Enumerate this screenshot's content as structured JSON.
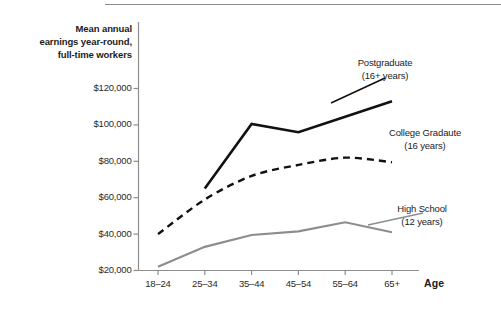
{
  "figure": {
    "axis_title_lines": [
      "Mean annual",
      "earnings year-round,",
      "full-time workers"
    ],
    "x_axis_name": "Age"
  },
  "chart_data": {
    "type": "line",
    "title": "Mean annual earnings year-round, full-time workers",
    "xlabel": "Age",
    "ylabel": "Mean annual earnings year-round, full-time workers",
    "categories": [
      "18–24",
      "25–34",
      "35–44",
      "45–54",
      "55–64",
      "65+"
    ],
    "ytick_labels": [
      "$20,000",
      "$40,000",
      "$60,000",
      "$80,000",
      "$100,000",
      "$120,000"
    ],
    "ytick_values": [
      20000,
      40000,
      60000,
      80000,
      100000,
      120000
    ],
    "ylim": [
      20000,
      130000
    ],
    "grid": false,
    "legend": "inline-right",
    "series": [
      {
        "name": "Postgraduate",
        "label_line1": "Postgraduate",
        "label_line2": "(16+ years)",
        "style": "solid",
        "color": "#111111",
        "width": 2.6,
        "x": [
          "25–34",
          "35–44",
          "45–54",
          "55–64",
          "65+"
        ],
        "values": [
          65000,
          100500,
          96000,
          104500,
          113000
        ]
      },
      {
        "name": "College Gradaute",
        "label_line1": "College Gradaute",
        "label_line2": "(16 years)",
        "style": "dashed",
        "color": "#111111",
        "width": 2.4,
        "x": [
          "18–24",
          "25–34",
          "35–44",
          "45–54",
          "55–64",
          "65+"
        ],
        "values": [
          40000,
          59000,
          72000,
          78000,
          82000,
          79500
        ]
      },
      {
        "name": "High School",
        "label_line1": "High School",
        "label_line2": "(12 years)",
        "style": "solid",
        "color": "#8d8d8d",
        "width": 2.2,
        "x": [
          "18–24",
          "25–34",
          "35–44",
          "45–54",
          "55–64",
          "65+"
        ],
        "values": [
          22000,
          33000,
          39500,
          41500,
          46500,
          41000
        ]
      }
    ]
  }
}
